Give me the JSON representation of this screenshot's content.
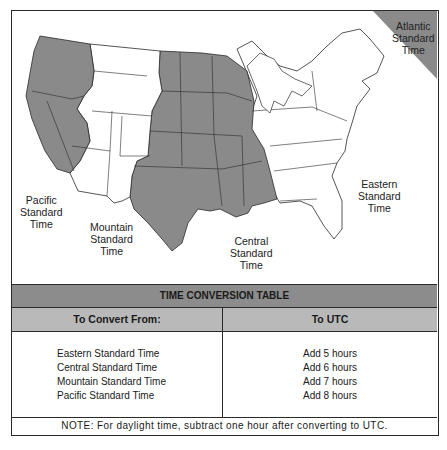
{
  "map": {
    "labels": {
      "atlantic": [
        "Atlantic",
        "Standard",
        "Time"
      ],
      "eastern": [
        "Eastern",
        "Standard",
        "Time"
      ],
      "central": [
        "Central",
        "Standard",
        "Time"
      ],
      "mountain": [
        "Mountain",
        "Standard",
        "Time"
      ],
      "pacific": [
        "Pacific",
        "Standard",
        "Time"
      ]
    },
    "colors": {
      "shaded": "#8a8a8a",
      "unshaded": "#ffffff",
      "border": "#2a2a2a"
    }
  },
  "table": {
    "title": "TIME CONVERSION TABLE",
    "headers": {
      "from": "To Convert From:",
      "to": "To UTC"
    },
    "rows": [
      {
        "from": "Eastern Standard Time",
        "to": "Add 5 hours"
      },
      {
        "from": "Central Standard Time",
        "to": "Add 6 hours"
      },
      {
        "from": "Mountain Standard Time",
        "to": "Add 7 hours"
      },
      {
        "from": "Pacific Standard Time",
        "to": "Add 8 hours"
      }
    ],
    "note": "NOTE: For daylight time, subtract one hour after converting to UTC.",
    "colors": {
      "title_bg": "#8c8c8c",
      "header_bg": "#b9b9b9"
    }
  }
}
